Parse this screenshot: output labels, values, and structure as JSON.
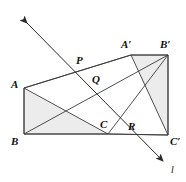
{
  "figure": {
    "type": "geometry-diagram",
    "background_color": "#ffffff",
    "stroke_color": "#3a3a3a",
    "fill_color": "#ececed",
    "label_color": "#111111"
  },
  "triangles": [
    {
      "name": "ABC",
      "vertices": [
        {
          "label": "A",
          "x": 24,
          "y": 88
        },
        {
          "label": "B",
          "x": 24,
          "y": 134
        },
        {
          "label": "C",
          "x": 108,
          "y": 134
        }
      ],
      "shaded": true
    },
    {
      "name": "A'B'C'",
      "vertices": [
        {
          "label": "A′",
          "x": 131,
          "y": 55
        },
        {
          "label": "B′",
          "x": 168,
          "y": 55
        },
        {
          "label": "C′",
          "x": 168,
          "y": 135
        }
      ],
      "shaded": true
    }
  ],
  "quadrilateral": {
    "name": "ABC'B'",
    "points": "24,88 131,55 168,55 168,135 108,134 24,134"
  },
  "connector_segments": [
    {
      "name": "A-to-A-prime",
      "from": [
        24,
        88
      ],
      "to": [
        131,
        55
      ]
    },
    {
      "name": "B-to-B-prime",
      "from": [
        24,
        134
      ],
      "to": [
        168,
        55
      ]
    },
    {
      "name": "C-to-C-prime",
      "from": [
        108,
        134
      ],
      "to": [
        168,
        135
      ]
    },
    {
      "name": "A-to-C",
      "from": [
        24,
        88
      ],
      "to": [
        108,
        134
      ]
    },
    {
      "name": "A-prime-to-C-prime",
      "from": [
        131,
        55
      ],
      "to": [
        168,
        135
      ]
    },
    {
      "name": "B-prime-to-C",
      "from": [
        168,
        55
      ],
      "to": [
        108,
        134
      ]
    },
    {
      "name": "A-to-B",
      "from": [
        24,
        88
      ],
      "to": [
        24,
        134
      ]
    },
    {
      "name": "B-to-C",
      "from": [
        24,
        134
      ],
      "to": [
        108,
        134
      ]
    },
    {
      "name": "A-prime-to-B-prime",
      "from": [
        131,
        55
      ],
      "to": [
        168,
        55
      ]
    },
    {
      "name": "B-prime-to-C-prime",
      "from": [
        168,
        55
      ],
      "to": [
        168,
        135
      ]
    }
  ],
  "line_l": {
    "label": "l",
    "start": [
      25,
      21
    ],
    "end": [
      165,
      163
    ],
    "arrow_both_ends": true,
    "label_position": [
      171,
      165
    ]
  },
  "intersection_points": [
    {
      "label": "P",
      "x": 86,
      "y": 70,
      "label_x": 76,
      "label_y": 55
    },
    {
      "label": "Q",
      "x": 100,
      "y": 85,
      "label_x": 92,
      "label_y": 74
    },
    {
      "label": "R",
      "x": 140,
      "y": 133,
      "label_x": 128,
      "label_y": 121
    }
  ],
  "labels": [
    {
      "text": "A",
      "x": 11,
      "y": 79
    },
    {
      "text": "B",
      "x": 11,
      "y": 136
    },
    {
      "text": "C",
      "x": 100,
      "y": 119
    },
    {
      "text": "A′",
      "x": 121,
      "y": 39
    },
    {
      "text": "B′",
      "x": 160,
      "y": 39
    },
    {
      "text": "C′",
      "x": 170,
      "y": 136
    },
    {
      "text": "P",
      "x": 76,
      "y": 55
    },
    {
      "text": "Q",
      "x": 92,
      "y": 74
    },
    {
      "text": "R",
      "x": 128,
      "y": 121
    },
    {
      "text": "l",
      "x": 171,
      "y": 165
    }
  ]
}
